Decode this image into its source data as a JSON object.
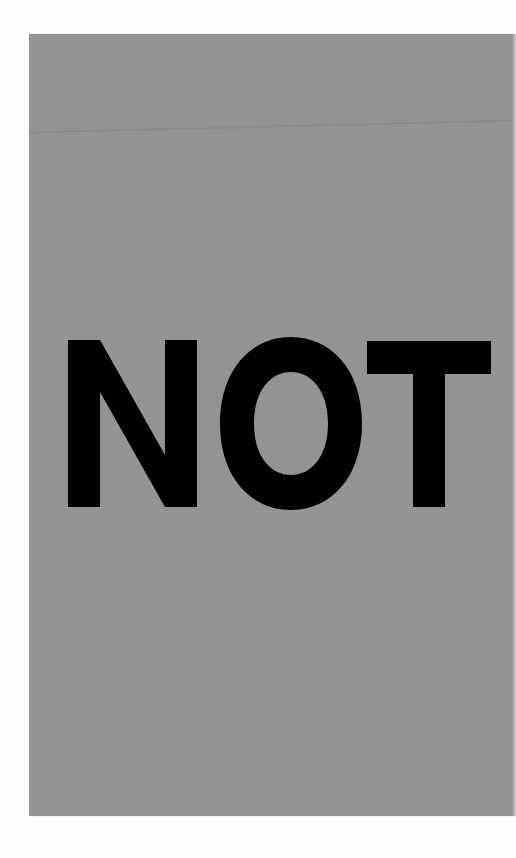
{
  "sign": {
    "text": "NOT",
    "letters": [
      "N",
      "O",
      "T"
    ],
    "colors": {
      "background": "#fdfdfd",
      "panel": "#949494",
      "text": "#000000"
    }
  }
}
